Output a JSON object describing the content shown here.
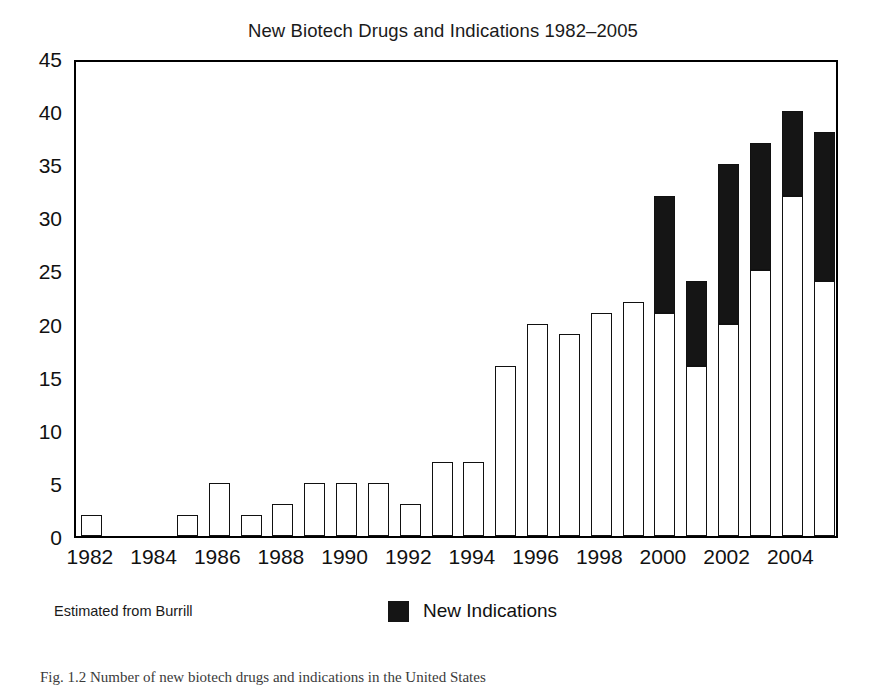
{
  "chart_data": {
    "type": "bar",
    "title": "New Biotech Drugs and Indications 1982–2005",
    "xlabel": "",
    "ylabel": "",
    "ylim": [
      0,
      45
    ],
    "yticks": [
      0,
      5,
      10,
      15,
      20,
      25,
      30,
      35,
      40,
      45
    ],
    "grid": false,
    "stacked": true,
    "legend_position": "bottom-center",
    "categories": [
      "1982",
      "1983",
      "1984",
      "1985",
      "1986",
      "1987",
      "1988",
      "1989",
      "1990",
      "1991",
      "1992",
      "1993",
      "1994",
      "1995",
      "1996",
      "1997",
      "1998",
      "1999",
      "2000",
      "2001",
      "2002",
      "2003",
      "2004",
      "2005"
    ],
    "xtick_labels": [
      "1982",
      "1984",
      "1986",
      "1988",
      "1990",
      "1992",
      "1994",
      "1996",
      "1998",
      "2000",
      "2002",
      "2004"
    ],
    "series": [
      {
        "name": "New Drugs",
        "color": "#ffffff",
        "values": [
          2,
          0,
          0,
          2,
          5,
          2,
          3,
          5,
          5,
          5,
          3,
          7,
          7,
          16,
          20,
          19,
          21,
          22,
          21,
          16,
          20,
          25,
          32,
          24
        ]
      },
      {
        "name": "New Indications",
        "color": "#151515",
        "values": [
          0,
          0,
          0,
          0,
          0,
          0,
          0,
          0,
          0,
          0,
          0,
          0,
          0,
          0,
          0,
          0,
          0,
          0,
          11,
          8,
          15,
          12,
          8,
          14
        ]
      }
    ],
    "totals": [
      2,
      0,
      0,
      2,
      5,
      2,
      3,
      5,
      5,
      5,
      3,
      7,
      7,
      16,
      20,
      19,
      21,
      22,
      32,
      24,
      35,
      37,
      40,
      38
    ]
  },
  "legend": {
    "entries": [
      {
        "label": "New Indications",
        "color": "#151515"
      }
    ]
  },
  "footnote": "Estimated from Burrill",
  "caption": "Fig. 1.2  Number of new biotech drugs and indications in the United States"
}
